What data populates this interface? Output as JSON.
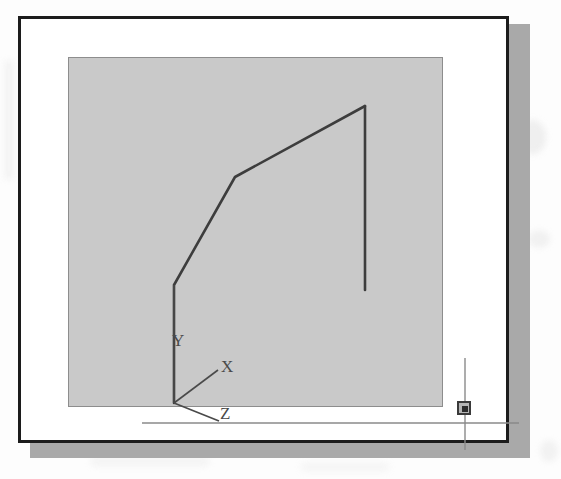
{
  "figure": {
    "kind": "cad-screenshot-scan",
    "page_background": "#fdfdfd"
  },
  "window": {
    "frame_color": "#1c1c1c",
    "interior_color": "#ffffff",
    "shadow_color": "#a9a9a9",
    "bounds": {
      "x": 18,
      "y": 16,
      "width": 491,
      "height": 427
    }
  },
  "canvas": {
    "name": "drawing-area",
    "background_color": "#c9c9c9",
    "border_color": "#8d8d8d",
    "bounds": {
      "x": 47,
      "y": 38,
      "width": 375,
      "height": 350
    }
  },
  "geometry": {
    "stroke_color": "#3d3d3d",
    "stroke_width": 2.6,
    "polyline_label": "profile-polyline",
    "polyline_points": "152,383 152,265 213,157 343,86",
    "vertical_edge_label": "right-vertical-edge",
    "vertical_edge_points": "343,86 343,270",
    "vertices": [
      {
        "name": "base",
        "x": 152,
        "y": 383
      },
      {
        "name": "lower-knee",
        "x": 152,
        "y": 265
      },
      {
        "name": "mid-knee",
        "x": 213,
        "y": 157
      },
      {
        "name": "apex",
        "x": 343,
        "y": 86
      },
      {
        "name": "right-edge-end",
        "x": 343,
        "y": 270
      }
    ]
  },
  "ucs_icon": {
    "name": "ucs-coordinate-tripod",
    "origin": {
      "x": 152,
      "y": 383
    },
    "stroke_color": "#4a4a4a",
    "stroke_width": 1.6,
    "axes": [
      {
        "label": "Y",
        "line": "152,383 152,265",
        "label_x": 150,
        "label_y": 326
      },
      {
        "label": "X",
        "line": "152,383 196,350",
        "label_x": 199,
        "label_y": 352
      },
      {
        "label": "Z",
        "line": "152,383 197,401",
        "label_x": 198,
        "label_y": 399
      }
    ]
  },
  "cursor": {
    "name": "crosshair-cursor",
    "stroke_color": "#8a8a8a",
    "stroke_width": 1.4,
    "center": {
      "x": 443,
      "y": 389
    },
    "horizontal_line": "120,403 497,403",
    "vertical_line": "443,338 443,430",
    "pickbox": {
      "name": "pickbox",
      "x": 436,
      "y": 382,
      "size": 14,
      "border_color": "#3a3a3a",
      "fill_color": "#b5b5b5",
      "core_color": "#2b2b2b"
    }
  }
}
